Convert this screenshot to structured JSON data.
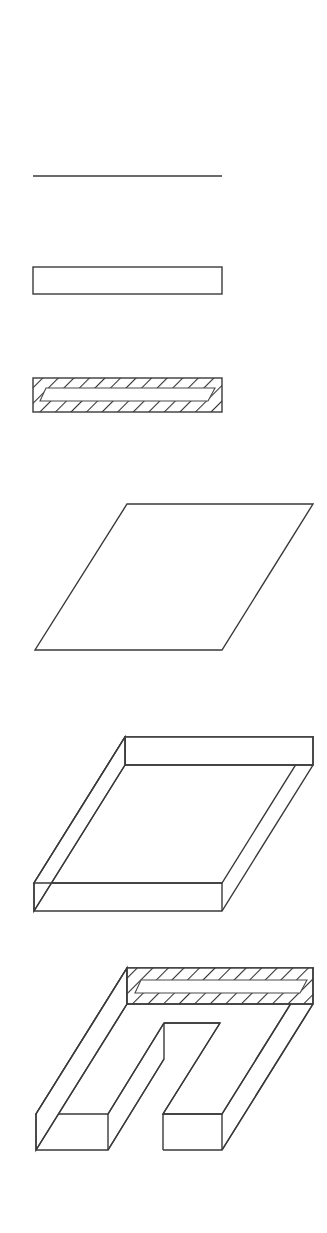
{
  "document": {
    "kind": "engineering-construction-sequence",
    "background_color": "#ffffff",
    "line_color": "#3a3a3a",
    "hatch_color": "#2e2e2e",
    "width": 327,
    "height": 1233,
    "figure_count": 6,
    "caption": ""
  },
  "figures": [
    {
      "id": "figure-1",
      "name": "reference-line",
      "label": "",
      "description": "single horizontal reference line",
      "geometry": {
        "type": "line",
        "x1": 33,
        "y1": 176,
        "x2": 222,
        "y2": 176
      }
    },
    {
      "id": "figure-2",
      "name": "outline-rectangle",
      "label": "",
      "description": "empty rectangle outline",
      "geometry": {
        "type": "rect",
        "x": 33,
        "y": 267,
        "width": 189,
        "height": 27
      }
    },
    {
      "id": "figure-3",
      "name": "hatched-section-bar",
      "label": "",
      "description": "section-hatched bar containing an inner unhatched slot band",
      "geometry": {
        "type": "hatched-rect-with-slot",
        "outer": {
          "x": 33,
          "y": 378,
          "width": 189,
          "height": 34
        },
        "slot": {
          "x": 40,
          "y": 388,
          "width": 175,
          "height": 13,
          "skew": 6
        },
        "hatch_angle_deg": 45,
        "hatch_spacing": 11
      }
    },
    {
      "id": "figure-4",
      "name": "plan-parallelogram",
      "label": "",
      "description": "flat parallelogram plan view in isometric skew",
      "geometry": {
        "type": "parallelogram",
        "points": "127,504 313,504 222,650 35,650"
      }
    },
    {
      "id": "figure-5",
      "name": "extruded-slab",
      "label": "",
      "description": "solid rectangular slab shown in isometric with top, front and left faces",
      "geometry": {
        "type": "slab",
        "top_face": "125,737 313,737 222,883 34,883",
        "front_face": "125,737 313,737 313,765 125,765",
        "left_face": "125,765 34,911 34,883 125,737",
        "bottom_edge": "34,911 222,911",
        "right_edge": "222,911 313,765",
        "thickness": 28
      }
    },
    {
      "id": "figure-6",
      "name": "slotted-slab-sectioned",
      "label": "",
      "description": "U-shaped slotted slab with section-hatched end face",
      "geometry": {
        "type": "slotted-slab",
        "hatch_angle_deg": 45,
        "hatch_spacing": 11,
        "outer_top": "127,968 313,968 222,1114 36,1114",
        "notch": "164,1037 220,1037 163,1128 108,1128",
        "end_face_outer": {
          "x": 127,
          "y": 968,
          "width": 186,
          "height": 36
        },
        "end_face_slot": {
          "x": 135,
          "y": 980,
          "width": 172,
          "height": 13
        },
        "thickness": 36
      }
    }
  ]
}
